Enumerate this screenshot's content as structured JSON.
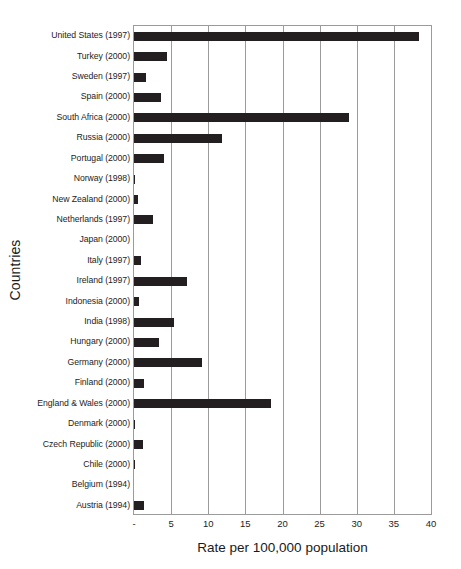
{
  "chart_data": {
    "type": "bar",
    "orientation": "horizontal",
    "title": "",
    "xlabel": "Rate per 100,000 population",
    "ylabel": "Countries",
    "xlim": [
      0,
      40
    ],
    "xticks": [
      0,
      5,
      10,
      15,
      20,
      25,
      30,
      35,
      40
    ],
    "xtick_labels": [
      "-",
      "5",
      "10",
      "15",
      "20",
      "25",
      "30",
      "35",
      "40"
    ],
    "grid": "vertical",
    "legend": "none",
    "bar_color": "#231f20",
    "categories": [
      "United States (1997)",
      "Turkey (2000)",
      "Sweden (1997)",
      "Spain (2000)",
      "South Africa (2000)",
      "Russia (2000)",
      "Portugal (2000)",
      "Norway (1998)",
      "New Zealand (2000)",
      "Netherlands (1997)",
      "Japan (2000)",
      "Italy (1997)",
      "Ireland (1997)",
      "Indonesia (2000)",
      "India (1998)",
      "Hungary (2000)",
      "Germany (2000)",
      "Finland (2000)",
      "England & Wales (2000)",
      "Denmark (2000)",
      "Czech Republic (2000)",
      "Chile (2000)",
      "Belgium (1994)",
      "Austria (1994)"
    ],
    "values": [
      38.4,
      4.4,
      1.6,
      3.7,
      28.9,
      11.9,
      4.0,
      0.15,
      0.5,
      2.6,
      0.0,
      0.9,
      7.2,
      0.7,
      5.4,
      3.3,
      9.2,
      1.3,
      18.4,
      0.2,
      1.2,
      0.15,
      0.0,
      1.3
    ]
  }
}
